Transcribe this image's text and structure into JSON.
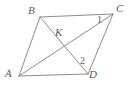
{
  "figure": {
    "type": "geometry-diagram",
    "shape": "parallelogram-with-diagonals",
    "width": 131,
    "height": 89,
    "background_color": "#ffffff",
    "stroke_color": "#8c8c8c",
    "label_color": "#5a5a5a",
    "vertices": [
      {
        "id": "B",
        "label": "B",
        "x": 40,
        "y": 17
      },
      {
        "id": "C",
        "label": "C",
        "x": 113,
        "y": 14
      },
      {
        "id": "A",
        "label": "A",
        "x": 19,
        "y": 76
      },
      {
        "id": "D",
        "label": "D",
        "x": 88,
        "y": 74
      }
    ],
    "interior_points": [
      {
        "id": "K",
        "label": "K",
        "x": 62,
        "y": 38
      }
    ],
    "angle_labels": [
      {
        "id": "angle-1",
        "label": "1",
        "at_vertex": "C",
        "x": 100,
        "y": 20
      },
      {
        "id": "angle-2",
        "label": "2",
        "at_vertex": "D",
        "x": 83,
        "y": 61
      }
    ],
    "segments": [
      {
        "id": "BC",
        "from": "B",
        "to": "C"
      },
      {
        "id": "AD",
        "from": "A",
        "to": "D"
      },
      {
        "id": "AB",
        "from": "A",
        "to": "B"
      },
      {
        "id": "CD",
        "from": "C",
        "to": "D"
      },
      {
        "id": "AC",
        "from": "A",
        "to": "C"
      },
      {
        "id": "BD",
        "from": "B",
        "to": "D"
      }
    ]
  }
}
